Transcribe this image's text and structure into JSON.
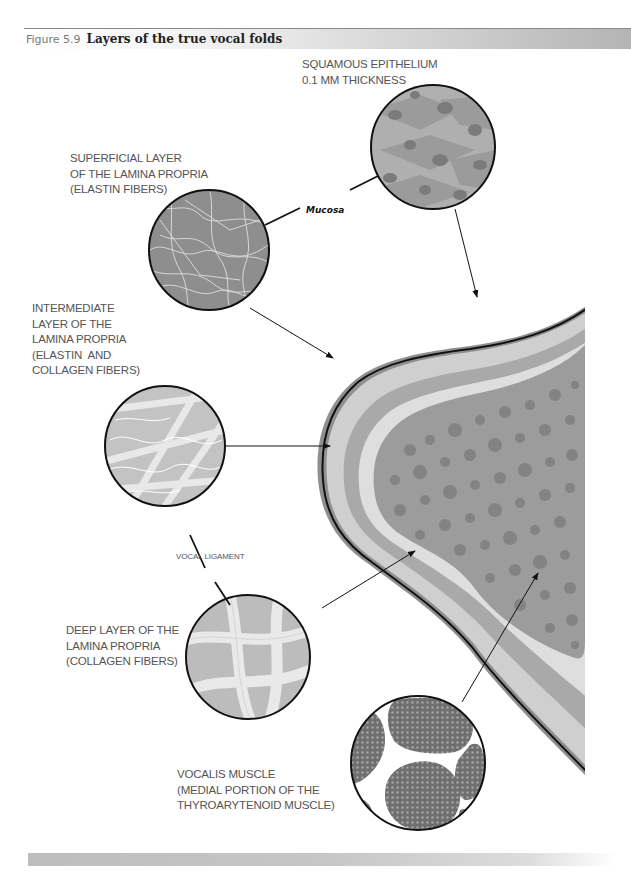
{
  "figure": {
    "number": "Figure 5.9",
    "title": "Layers of the true vocal folds"
  },
  "labels": {
    "squamous_epithelium": "SQUAMOUS EPITHELIUM\n0.1 MM THICKNESS",
    "superficial_layer": "SUPERFICIAL LAYER\nOF THE LAMINA PROPRIA\n(ELASTIN FIBERS)",
    "mucosa": "Mucosa",
    "intermediate_layer": "INTERMEDIATE\nLAYER OF THE\nLAMINA PROPRIA\n(ELASTIN  AND\nCOLLAGEN FIBERS)",
    "vocal_ligament": "VOCAL LIGAMENT",
    "deep_layer": "DEEP LAYER OF THE\nLAMINA PROPRIA\n(COLLAGEN FIBERS)",
    "vocalis_muscle": "VOCALIS MUSCLE\n(MEDIAL PORTION OF THE\nTHYROARYTENOID MUSCLE)"
  },
  "colors": {
    "outer_edge": "#8f8f8f",
    "superficial": "#cfcfcf",
    "intermediate": "#a9a9a9",
    "deep": "#dedede",
    "muscle": "#9c9c9c",
    "muscle_cells": "#7f7f7f",
    "outline": "#111111"
  }
}
